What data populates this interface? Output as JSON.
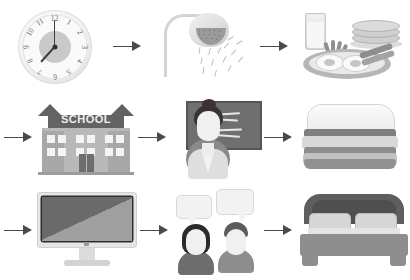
{
  "diagram": {
    "type": "pictorial-flow",
    "columns": 3,
    "rows": 3,
    "arrow_glyph": "→",
    "colors": {
      "background": "#ffffff",
      "arrow": "#4a4a4a",
      "light_gray": "#e6e6e6",
      "mid_gray": "#b9b9b9",
      "dark_gray": "#6f6f6f",
      "near_black": "#2e2a2c"
    },
    "rows_data": [
      {
        "row_index": 1,
        "leading_arrow": false,
        "cells": [
          {
            "name": "alarm-clock",
            "label": "Alarm clock",
            "clock": {
              "hour_hand": "7",
              "minute_hand": "12",
              "time": "7:00",
              "numerals": [
                "1",
                "2",
                "3",
                "4",
                "5",
                "6",
                "7",
                "8",
                "9",
                "10",
                "11",
                "12"
              ]
            }
          },
          {
            "name": "shower",
            "label": "Shower"
          },
          {
            "name": "breakfast",
            "label": "Breakfast",
            "items": [
              "fried eggs",
              "bacon",
              "pancakes",
              "glass of milk"
            ]
          }
        ]
      },
      {
        "row_index": 2,
        "leading_arrow": true,
        "cells": [
          {
            "name": "school",
            "label": "School",
            "sign_text": "SCHOOL"
          },
          {
            "name": "teacher-classroom",
            "label": "Teacher at blackboard"
          },
          {
            "name": "sandwich",
            "label": "Sandwich lunch"
          }
        ]
      },
      {
        "row_index": 3,
        "leading_arrow": true,
        "cells": [
          {
            "name": "computer",
            "label": "Computer"
          },
          {
            "name": "conversation",
            "label": "Talking with friend"
          },
          {
            "name": "bed",
            "label": "Bed / sleep"
          }
        ]
      }
    ]
  }
}
